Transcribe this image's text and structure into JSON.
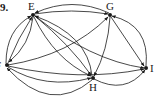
{
  "problem_number": "9.",
  "graph": {
    "type": "directed multigraph",
    "nodes": [
      {
        "id": "E",
        "label": "E",
        "x": 33,
        "y": 15
      },
      {
        "id": "G",
        "label": "G",
        "x": 110,
        "y": 15
      },
      {
        "id": "F",
        "label": "F",
        "x": 7,
        "y": 65
      },
      {
        "id": "H",
        "label": "H",
        "x": 93,
        "y": 78
      },
      {
        "id": "I",
        "label": "I",
        "x": 146,
        "y": 68
      }
    ],
    "edges": [
      {
        "from": "E",
        "to": "G"
      },
      {
        "from": "G",
        "to": "E"
      },
      {
        "from": "E",
        "to": "F"
      },
      {
        "from": "F",
        "to": "E"
      },
      {
        "from": "F",
        "to": "G"
      },
      {
        "from": "E",
        "to": "H"
      },
      {
        "from": "H",
        "to": "E"
      },
      {
        "from": "E",
        "to": "I"
      },
      {
        "from": "G",
        "to": "I"
      },
      {
        "from": "I",
        "to": "G"
      },
      {
        "from": "G",
        "to": "H"
      },
      {
        "from": "F",
        "to": "I"
      },
      {
        "from": "F",
        "to": "H"
      },
      {
        "from": "H",
        "to": "F"
      },
      {
        "from": "H",
        "to": "I"
      }
    ]
  },
  "colors": {
    "ink": "#1a1a1a",
    "background": "#ffffff"
  }
}
